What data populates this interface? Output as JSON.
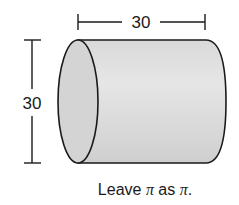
{
  "figure": {
    "shape": "cylinder",
    "orientation": "horizontal",
    "dimensions": {
      "length": {
        "label": "30",
        "value": 30
      },
      "diameter": {
        "label": "30",
        "value": 30
      }
    },
    "colors": {
      "stroke": "#1a1a1a",
      "body_fill": "#dcdcdc",
      "end_fill": "#d2d2d2"
    }
  },
  "caption": {
    "prefix": "Leave ",
    "pi1": "π",
    "middle": " as ",
    "pi2": "π",
    "suffix": "."
  }
}
